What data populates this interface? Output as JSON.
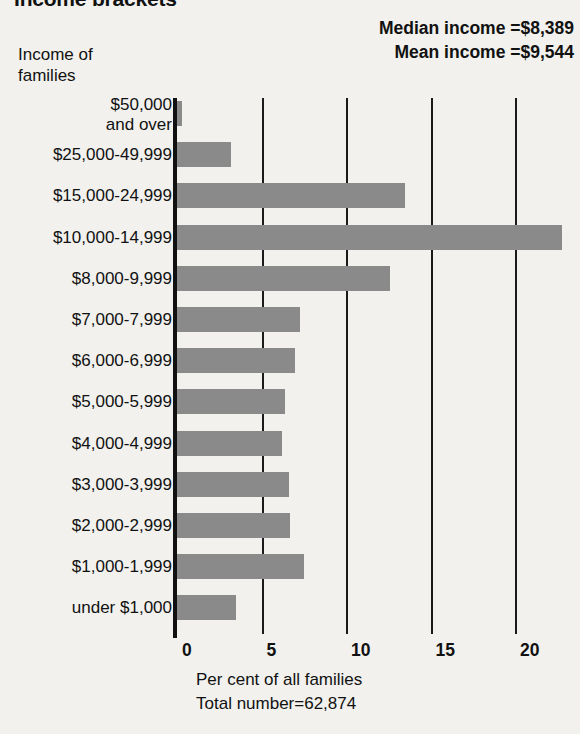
{
  "title": "Income brackets",
  "stats": {
    "median_label": "Median income =$8,389",
    "mean_label": "Mean income =$9,544"
  },
  "y_axis_caption": {
    "line1": "Income of",
    "line2": "families"
  },
  "x_axis_caption": {
    "line1": "Per cent of all families",
    "line2": "Total number=62,874"
  },
  "chart_data": {
    "type": "bar",
    "orientation": "horizontal",
    "title": "Income brackets",
    "xlabel": "Per cent of all families",
    "ylabel": "Income of families",
    "xlim": [
      0,
      23
    ],
    "grid": true,
    "legend": "none",
    "xticks": [
      "0",
      "5",
      "10",
      "15",
      "20"
    ],
    "xtick_values": [
      0,
      5,
      10,
      15,
      20
    ],
    "categories": [
      "$50,000 and over",
      "$25,000-49,999",
      "$15,000-24,999",
      "$10,000-14,999",
      "$8,000-9,999",
      "$7,000-7,999",
      "$6,000-6,999",
      "$5,000-5,999",
      "$4,000-4,999",
      "$3,000-3,999",
      "$2,000-2,999",
      "$1,000-1,999",
      "under $1,000"
    ],
    "category_labels_display": [
      {
        "line1": "$50,000",
        "line2": "and over"
      },
      {
        "line1": "$25,000-49,999",
        "line2": ""
      },
      {
        "line1": "$15,000-24,999",
        "line2": ""
      },
      {
        "line1": "$10,000-14,999",
        "line2": ""
      },
      {
        "line1": "$8,000-9,999",
        "line2": ""
      },
      {
        "line1": "$7,000-7,999",
        "line2": ""
      },
      {
        "line1": "$6,000-6,999",
        "line2": ""
      },
      {
        "line1": "$5,000-5,999",
        "line2": ""
      },
      {
        "line1": "$4,000-4,999",
        "line2": ""
      },
      {
        "line1": "$3,000-3,999",
        "line2": ""
      },
      {
        "line1": "$2,000-2,999",
        "line2": ""
      },
      {
        "line1": "$1,000-1,999",
        "line2": ""
      },
      {
        "line1": "under $1,000",
        "line2": ""
      }
    ],
    "values": [
      0.3,
      3.2,
      13.5,
      22.8,
      12.6,
      7.3,
      7.0,
      6.4,
      6.2,
      6.6,
      6.7,
      7.5,
      3.5
    ],
    "annotations": [
      "Median income =$8,389",
      "Mean income =$9,544",
      "Total number=62,874"
    ]
  },
  "colors": {
    "bar": "#8a8a8a",
    "axis": "#111111",
    "background": "#f2f1ee",
    "text": "#111111"
  }
}
